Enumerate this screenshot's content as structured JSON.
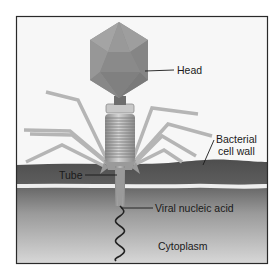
{
  "diagram": {
    "labels": {
      "head": "Head",
      "cell_wall_line1": "Bacterial",
      "cell_wall_line2": "cell wall",
      "tube": "Tube",
      "nucleic_acid": "Viral nucleic acid",
      "cytoplasm": "Cytoplasm"
    },
    "colors": {
      "frame_border": "#2a2a2a",
      "background": "#f7f7f7",
      "head": "#8e8e8e",
      "head_light": "#a9a9a9",
      "head_dark": "#777777",
      "tail_fiber": "#b8b8b8",
      "sheath": "#a5a5a5",
      "cell_wall": "#555555",
      "membrane_line": "#eeeeee",
      "cytoplasm_top": "#6a6a6a",
      "cytoplasm_bottom": "#d6d6d6",
      "dna": "#222222",
      "leader_line": "#1a1a1a"
    }
  }
}
